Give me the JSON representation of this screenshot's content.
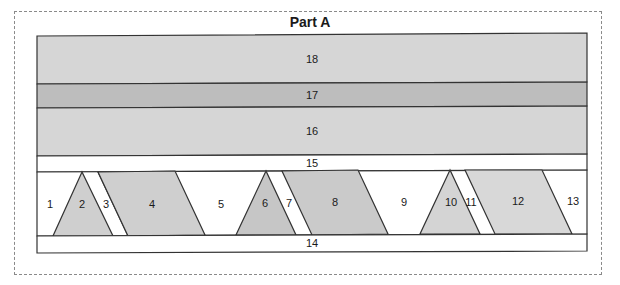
{
  "title": "Part A",
  "colors": {
    "light_gray": "#d6d6d6",
    "medium_gray": "#bdbdbd",
    "piece_gray": "#cfcfcf",
    "white": "#ffffff",
    "line": "#333333",
    "dashed_border": "#8a8a8a"
  },
  "strips": [
    {
      "id": "18",
      "label": "18",
      "fill": "light_gray"
    },
    {
      "id": "17",
      "label": "17",
      "fill": "medium_gray"
    },
    {
      "id": "16",
      "label": "16",
      "fill": "light_gray"
    },
    {
      "id": "15",
      "label": "15",
      "fill": "white"
    },
    {
      "id": "14",
      "label": "14",
      "fill": "white"
    }
  ],
  "pieces": [
    {
      "id": "1",
      "label": "1",
      "fill": "white"
    },
    {
      "id": "2",
      "label": "2",
      "fill": "piece_gray"
    },
    {
      "id": "3",
      "label": "3",
      "fill": "white"
    },
    {
      "id": "4",
      "label": "4",
      "fill": "piece_gray"
    },
    {
      "id": "5",
      "label": "5",
      "fill": "white"
    },
    {
      "id": "6",
      "label": "6",
      "fill": "piece_gray"
    },
    {
      "id": "7",
      "label": "7",
      "fill": "white"
    },
    {
      "id": "8",
      "label": "8",
      "fill": "piece_gray"
    },
    {
      "id": "9",
      "label": "9",
      "fill": "white"
    },
    {
      "id": "10",
      "label": "10",
      "fill": "piece_gray"
    },
    {
      "id": "11",
      "label": "11",
      "fill": "white"
    },
    {
      "id": "12",
      "label": "12",
      "fill": "piece_gray"
    },
    {
      "id": "13",
      "label": "13",
      "fill": "white"
    }
  ]
}
